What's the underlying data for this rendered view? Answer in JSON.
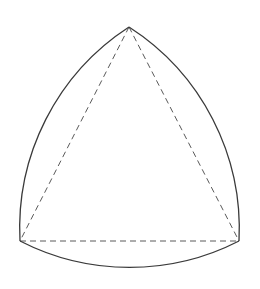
{
  "diagram": {
    "type": "reuleaux-triangle",
    "colors": {
      "background": "#ffffff",
      "arc": "#3a3a3a",
      "dashed": "#5a5a5a"
    },
    "vertices": {
      "top": [
        129,
        27
      ],
      "bottom_left": [
        20,
        241
      ],
      "bottom_right": [
        239,
        241
      ]
    },
    "arcs": [
      {
        "name": "left-arc",
        "from": "bottom_left",
        "to": "top",
        "radius": 240
      },
      {
        "name": "right-arc",
        "from": "top",
        "to": "bottom_right",
        "radius": 240
      },
      {
        "name": "bottom-arc",
        "from": "bottom_right",
        "to": "bottom_left",
        "radius": 240
      }
    ],
    "dashed_triangle": [
      "top",
      "bottom_left",
      "bottom_right"
    ]
  }
}
